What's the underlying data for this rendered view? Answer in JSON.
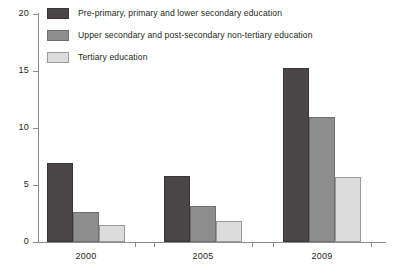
{
  "chart_data": {
    "type": "bar",
    "title": "",
    "subtitle": "",
    "xlabel": "",
    "ylabel": "",
    "categories": [
      "2000",
      "2005",
      "2009"
    ],
    "series": [
      {
        "name": "Pre-primary, primary and lower secondary education",
        "color": "#4a4648",
        "values": [
          6.9,
          5.8,
          15.3
        ]
      },
      {
        "name": "Upper secondary and post-secondary non-tertiary education",
        "color": "#8d8d8d",
        "values": [
          2.6,
          3.2,
          11.0
        ]
      },
      {
        "name": "Tertiary education",
        "color": "#dcdcdc",
        "values": [
          1.5,
          1.8,
          5.7
        ]
      }
    ],
    "ylim": [
      0,
      20
    ],
    "yticks": [
      0,
      5,
      10,
      15,
      20
    ],
    "ytick_labels": [
      "0",
      "5",
      "10",
      "15",
      "20"
    ],
    "grid": false,
    "legend_position": "top-left"
  },
  "axis": {
    "axis_color": "#8c8c8c"
  }
}
